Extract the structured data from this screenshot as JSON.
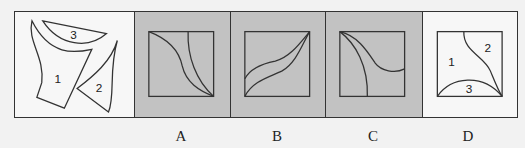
{
  "puzzle": {
    "source_panel": {
      "pieces": [
        {
          "id": "1",
          "label": "1"
        },
        {
          "id": "2",
          "label": "2"
        },
        {
          "id": "3",
          "label": "3"
        }
      ]
    },
    "options": [
      {
        "id": "A",
        "label": "A",
        "background": "gray"
      },
      {
        "id": "B",
        "label": "B",
        "background": "gray"
      },
      {
        "id": "C",
        "label": "C",
        "background": "gray"
      },
      {
        "id": "D",
        "label": "D",
        "background": "white",
        "region_labels": [
          "1",
          "2",
          "3"
        ]
      }
    ]
  },
  "colors": {
    "page_background": "#f2f2f2",
    "option_gray": "#c2c2c2",
    "stroke": "#333333"
  }
}
